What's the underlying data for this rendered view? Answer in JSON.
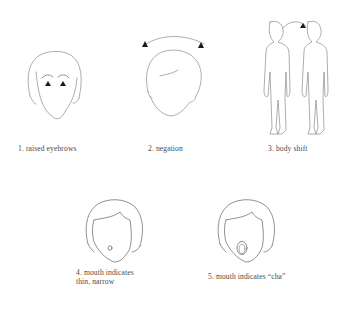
{
  "figures": [
    {
      "id": 1,
      "caption": "1. raised eyebrows",
      "icon": "face-raised-eyebrows-icon"
    },
    {
      "id": 2,
      "caption": "2. negation",
      "icon": "head-shake-icon"
    },
    {
      "id": 3,
      "caption": "3. body shift",
      "icon": "body-shift-icon"
    },
    {
      "id": 4,
      "caption_line1": "4. mouth indicates",
      "caption_line2": "thin, narrow",
      "icon": "face-narrow-mouth-icon"
    },
    {
      "id": 5,
      "caption": "5. mouth indicates “cha”",
      "icon": "face-open-mouth-icon"
    }
  ],
  "colors": {
    "line": "#8a8a8a",
    "marker": "#1a1a1a",
    "text": "#4a4a4a",
    "background": "#ffffff"
  }
}
